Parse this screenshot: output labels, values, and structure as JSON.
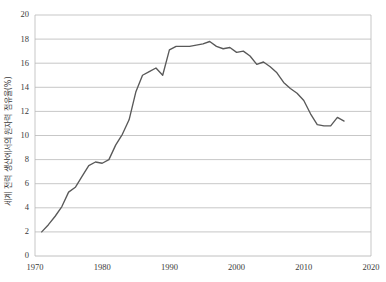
{
  "chart_data": {
    "type": "line",
    "title": "",
    "xlabel": "",
    "ylabel": "세계 전력 생산에서의 원자력 점유율(%)",
    "xlim": [
      1970,
      2020
    ],
    "ylim": [
      0,
      20
    ],
    "ytick_step": 2,
    "xtick_step": 10,
    "grid": true,
    "legend": "none",
    "line_color": "#595959",
    "grid_color": "#b9b9b9",
    "xticks": [
      "1970",
      "1980",
      "1990",
      "2000",
      "2010",
      "2020"
    ],
    "yticks": [
      "0",
      "2",
      "4",
      "6",
      "8",
      "10",
      "12",
      "14",
      "16",
      "18",
      "20"
    ],
    "series": [
      {
        "name": "세계 전력 생산에서의 원자력 점유율(%)",
        "x": [
          1971,
          1972,
          1973,
          1974,
          1975,
          1976,
          1977,
          1978,
          1979,
          1980,
          1981,
          1982,
          1983,
          1984,
          1985,
          1986,
          1987,
          1988,
          1989,
          1990,
          1991,
          1992,
          1993,
          1994,
          1995,
          1996,
          1997,
          1998,
          1999,
          2000,
          2001,
          2002,
          2003,
          2004,
          2005,
          2006,
          2007,
          2008,
          2009,
          2010,
          2011,
          2012,
          2013,
          2014,
          2015,
          2016
        ],
        "values": [
          2.0,
          2.6,
          3.3,
          4.1,
          5.3,
          5.7,
          6.6,
          7.5,
          7.8,
          7.7,
          8.0,
          9.2,
          10.1,
          11.3,
          13.6,
          15.0,
          15.3,
          15.6,
          15.0,
          17.1,
          17.4,
          17.4,
          17.4,
          17.5,
          17.6,
          17.8,
          17.4,
          17.2,
          17.3,
          16.9,
          17.0,
          16.6,
          15.9,
          16.1,
          15.7,
          15.2,
          14.4,
          13.9,
          13.5,
          12.9,
          11.8,
          10.9,
          10.8,
          10.8,
          11.5,
          11.2
        ]
      }
    ]
  }
}
